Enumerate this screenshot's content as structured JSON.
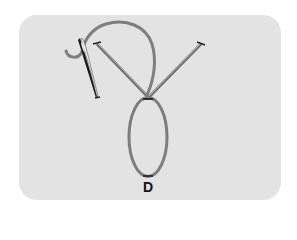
{
  "diagram": {
    "type": "embroidery-stitch",
    "step_label": "D",
    "colors": {
      "background": "#ffffff",
      "card": "#e3e3e3",
      "thread": "#7f7f7f",
      "stitch_line": "#6f6f6f",
      "needle_dark": "#1a1a1a",
      "needle_highlight": "#f5f5f5",
      "label": "#111111"
    },
    "points": {
      "left_anchor": [
        96,
        43
      ],
      "right_anchor": [
        202,
        43
      ],
      "junction": [
        148,
        98
      ],
      "loop_bottom": [
        148,
        176
      ]
    }
  }
}
